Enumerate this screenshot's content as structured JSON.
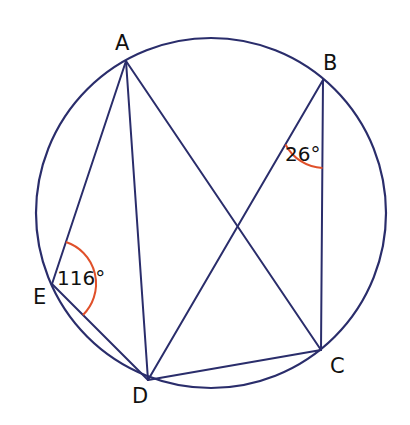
{
  "figure": {
    "type": "circle-geometry",
    "colors": {
      "line": "#2a2d6b",
      "angle_arc": "#e0502a",
      "text": "#111111",
      "background": "#ffffff"
    },
    "circle": {
      "cx": 211,
      "cy": 213,
      "r": 175
    },
    "points": [
      {
        "name": "A",
        "x": 126,
        "y": 61,
        "label_x": 114,
        "label_y": 50
      },
      {
        "name": "B",
        "x": 323,
        "y": 80,
        "label_x": 322,
        "label_y": 70
      },
      {
        "name": "C",
        "x": 321,
        "y": 350,
        "label_x": 330,
        "label_y": 372
      },
      {
        "name": "D",
        "x": 148,
        "y": 380,
        "label_x": 131,
        "label_y": 402
      },
      {
        "name": "E",
        "x": 52,
        "y": 284,
        "label_x": 34,
        "label_y": 303
      }
    ],
    "segments": [
      "AE",
      "ED",
      "AD",
      "AC",
      "BD",
      "BC",
      "DC"
    ],
    "angles": [
      {
        "vertex": "B",
        "between": [
          "A?",
          "C"
        ],
        "label": "26°",
        "label_x": 286,
        "label_y": 160
      },
      {
        "vertex": "E",
        "between": [
          "A",
          "D"
        ],
        "label": "116°",
        "label_x": 61,
        "label_y": 284
      }
    ]
  },
  "labels": {
    "A": "A",
    "B": "B",
    "C": "C",
    "D": "D",
    "E": "E",
    "angle_B": "26°",
    "angle_E": "116°"
  }
}
